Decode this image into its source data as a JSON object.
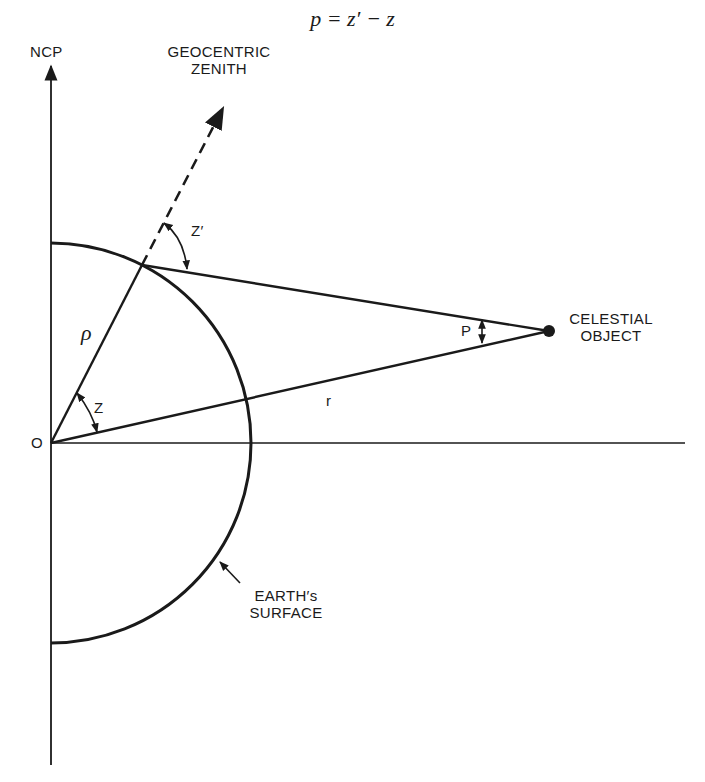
{
  "formula": "p = z′ − z",
  "labels": {
    "ncp": "NCP",
    "zenith_line1": "GEOCENTRIC",
    "zenith_line2": "ZENITH",
    "z_prime": "Z′",
    "rho": "ρ",
    "z": "Z",
    "origin": "O",
    "r": "r",
    "p": "P",
    "object_line1": "CELESTIAL",
    "object_line2": "OBJECT",
    "surface_line1": "EARTH′s",
    "surface_line2": "SURFACE"
  },
  "geometry": {
    "origin": [
      51,
      443
    ],
    "earth_radius": 200,
    "observer": [
      142,
      265
    ],
    "celestial_object": [
      549,
      331
    ],
    "stroke_color": "#1a1a1a"
  }
}
